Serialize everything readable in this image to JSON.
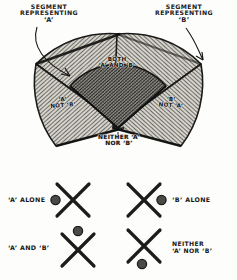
{
  "figure": {
    "callout_left": {
      "line1": "SEGMENT",
      "line2": "REPRESENTING",
      "line3": "‘A’"
    },
    "callout_right": {
      "line1": "SEGMENT",
      "line2": "REPRESENTING",
      "line3": "‘B’"
    },
    "regions": {
      "both": {
        "line1": "BOTH",
        "line2": "‘A’ AND ‘B’"
      },
      "a_not_b": {
        "line1": "‘A’",
        "line2": "NOT ‘B’"
      },
      "b_not_a": {
        "line1": "‘B’",
        "line2": "NOT ‘A’"
      },
      "neither": {
        "line1": "NEITHER ‘A’",
        "line2": "NOR ‘B’"
      }
    }
  },
  "legend": {
    "items": [
      {
        "id": "a-alone",
        "line1": "‘A’ ALONE",
        "line2": "",
        "dot_position": "west",
        "text_side": "left"
      },
      {
        "id": "b-alone",
        "line1": "‘B’ ALONE",
        "line2": "",
        "dot_position": "east",
        "text_side": "right"
      },
      {
        "id": "a-and-b",
        "line1": "‘A’ AND ‘B’",
        "line2": "",
        "dot_position": "north",
        "text_side": "left"
      },
      {
        "id": "neither",
        "line1": "NEITHER",
        "line2": "‘A’ NOR ‘B’",
        "dot_position": "south",
        "text_side": "right"
      }
    ]
  },
  "colors": {
    "ink": "#1b1b1b",
    "paper": "#fdfdfc",
    "hatch": "#3a3a38",
    "overlap_fill": "#8d8a83",
    "sector_fill": "#cfccc4",
    "edge_dark": "#1a1a18"
  }
}
